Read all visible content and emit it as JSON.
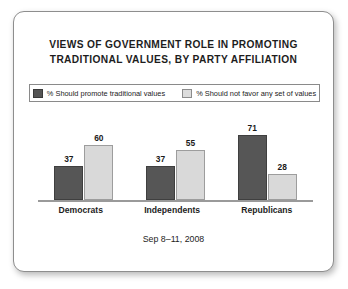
{
  "chart_data": {
    "type": "bar",
    "title": "VIEWS OF GOVERNMENT ROLE IN PROMOTING TRADITIONAL VALUES, BY PARTY AFFILIATION",
    "title_lines": [
      "VIEWS OF GOVERNMENT ROLE IN PROMOTING",
      "TRADITIONAL VALUES, BY PARTY AFFILIATION"
    ],
    "subtitle": "Sep 8–11, 2008",
    "xlabel": "",
    "ylabel": "",
    "ylim": [
      0,
      80
    ],
    "grid": false,
    "legend_position": "top",
    "categories": [
      "Democrats",
      "Independents",
      "Republicans"
    ],
    "series": [
      {
        "name": "% Should promote traditional values",
        "color": "#565656",
        "values": [
          37,
          37,
          71
        ]
      },
      {
        "name": "% Should not favor any set of values",
        "color": "#d9d9d9",
        "values": [
          60,
          55,
          28
        ]
      }
    ]
  },
  "legend": {
    "items": [
      {
        "label": "% Should promote traditional values",
        "swatch": "dark"
      },
      {
        "label": "% Should not favor any set of values",
        "swatch": "light"
      }
    ]
  },
  "colors": {
    "series_dark": "#565656",
    "series_light": "#d9d9d9",
    "text": "#1d1d1d",
    "axis": "#9a9a9a",
    "card_border": "#8e8e8e",
    "background": "#ffffff"
  }
}
